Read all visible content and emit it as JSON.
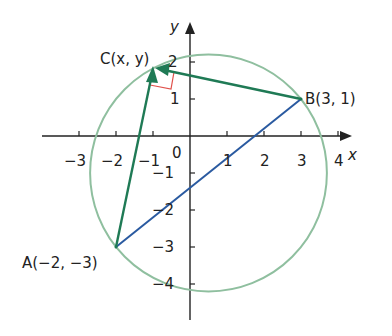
{
  "diagram": {
    "axes": {
      "x_label": "x",
      "y_label": "y",
      "origin_label": "0",
      "x_ticks": [
        "−3",
        "−2",
        "−1",
        "1",
        "2",
        "3",
        "4"
      ],
      "y_ticks": [
        "2",
        "1",
        "−1",
        "−2",
        "−3",
        "−4"
      ]
    },
    "points": {
      "A": {
        "label": "A(−2, −3)",
        "x": -2,
        "y": -3
      },
      "B": {
        "label": "B(3, 1)",
        "x": 3,
        "y": 1
      },
      "C": {
        "label": "C(x, y)",
        "x": -1,
        "y": 1.8
      }
    },
    "circle": {
      "center": [
        0.5,
        -1
      ],
      "radius": 3.2
    },
    "colors": {
      "circle": "#8fbf9f",
      "vectors": "#1f7a55",
      "chord_AB": "#2a5aa0",
      "right_angle": "#e0504a",
      "axes": "#222222"
    }
  }
}
